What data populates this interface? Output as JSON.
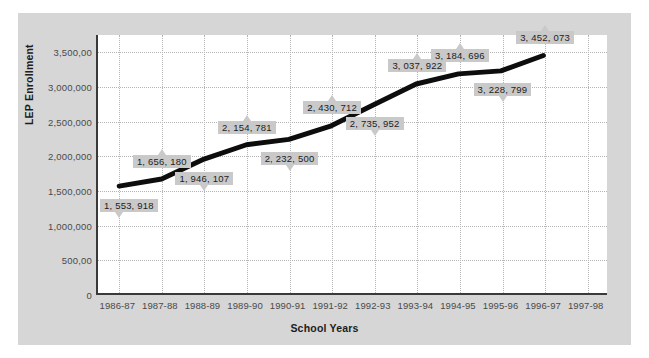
{
  "chart_data": {
    "type": "line",
    "title": "",
    "xlabel": "School Years",
    "ylabel": "LEP Enrollment",
    "categories": [
      "1986-87",
      "1987-88",
      "1988-89",
      "1989-90",
      "1990-91",
      "1991-92",
      "1992-93",
      "1993-94",
      "1994-95",
      "1995-96",
      "1996-97",
      "1997-98"
    ],
    "x_tick_labels": [
      "1986-87",
      "1987-88",
      "1988-89",
      "1989-90",
      "1990-91",
      "1991-92",
      "1992-93",
      "1993-94",
      "1994-95",
      "1995-96",
      "1996-97",
      "1997-98"
    ],
    "y_tick_labels": [
      "0",
      "500,00",
      "1,000,000",
      "1,500,000",
      "2,000,000",
      "2,500,000",
      "3,000,000",
      "3,500,00"
    ],
    "y_tick_values": [
      0,
      500000,
      1000000,
      1500000,
      2000000,
      2500000,
      3000000,
      3500000
    ],
    "ylim": [
      0,
      3750000
    ],
    "grid": true,
    "legend": "none",
    "series": [
      {
        "name": "LEP Enrollment",
        "color": "#0d0d0d",
        "line_width": 5,
        "x": [
          "1986-87",
          "1987-88",
          "1988-89",
          "1989-90",
          "1990-91",
          "1991-92",
          "1992-93",
          "1993-94",
          "1994-95",
          "1995-96",
          "1996-97"
        ],
        "values": [
          1553918,
          1656180,
          1946107,
          2154781,
          2232500,
          2430712,
          2735952,
          3037922,
          3184696,
          3228799,
          3452073
        ],
        "point_labels": [
          "1, 553, 918",
          "1, 656, 180",
          "1, 946, 107",
          "2, 154, 781",
          "2, 232, 500",
          "2, 430, 712",
          "2, 735, 952",
          "3, 037, 922",
          "3, 184, 696",
          "3, 228, 799",
          "3, 452, 073"
        ],
        "label_positions": [
          "below",
          "above",
          "below",
          "above",
          "below",
          "above",
          "below",
          "above",
          "above",
          "below",
          "above"
        ]
      }
    ]
  },
  "style": {
    "panel_bg": "#d6d6d6",
    "plot_bg": "#ffffff",
    "grid_color": "#b4b4b4",
    "axis_color": "#3a3a3a",
    "callout_bg": "#c9c9c9",
    "text_color": "#4a4a4a",
    "title_color": "#1c1c1c"
  }
}
